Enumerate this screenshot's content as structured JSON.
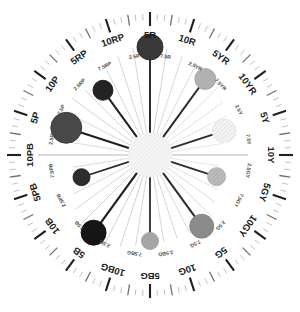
{
  "figure": {
    "type": "polar-hue-wheel",
    "center_x": 150,
    "center_y": 155,
    "background_color": "#ffffff"
  },
  "geometry": {
    "outer_tick_ring_radius": 141,
    "outer_tick_ring_inner_radius": 133,
    "major_label_radius": 121,
    "minor_label_radius": 100,
    "spoke_inner_radius": 22,
    "spoke_outer_radius": 112,
    "hub_radius": 22,
    "hub_fill": "#f2f2f2",
    "hub_hatch_color": "#e2e2e2"
  },
  "chart_data": {
    "type": "scatter",
    "subtitle": "",
    "xlabel": "",
    "ylabel": "",
    "coordinate_system": "polar",
    "angle_units": "degrees",
    "angle_zero_at": "top",
    "angle_direction": "clockwise",
    "grid": true,
    "legend": false,
    "n_spokes": 40,
    "spoke_step_degrees": 9,
    "hue_labels_major": [
      "5R",
      "10R",
      "5YR",
      "10YR",
      "5Y",
      "10Y",
      "5GY",
      "10GY",
      "5G",
      "10G",
      "5BG",
      "10BG",
      "5B",
      "10B",
      "5PB",
      "10PB",
      "5P",
      "10P",
      "5RP",
      "10RP"
    ],
    "hue_labels_minor": [
      "2.5R",
      "7.5R",
      "2.5YR",
      "7.5YR",
      "2.5Y",
      "7.5Y",
      "2.5GY",
      "7.5GY",
      "2.5G",
      "7.5G",
      "2.5BG",
      "7.5BG",
      "2.5B",
      "7.5B",
      "2.5PB",
      "7.5PB",
      "2.5P",
      "7.5P",
      "2.5RP",
      "7.5RP"
    ],
    "categories": [
      "5R",
      "7.5R",
      "10R",
      "2.5YR",
      "5YR",
      "7.5YR",
      "10YR",
      "2.5Y",
      "5Y",
      "7.5Y",
      "10Y",
      "2.5GY",
      "5GY",
      "7.5GY",
      "10GY",
      "2.5G",
      "5G",
      "7.5G",
      "10G",
      "2.5BG",
      "5BG",
      "7.5BG",
      "10BG",
      "2.5B",
      "5B",
      "7.5B",
      "10B",
      "2.5PB",
      "5PB",
      "7.5PB",
      "10PB",
      "2.5P",
      "5P",
      "7.5P",
      "10P",
      "2.5RP",
      "5RP",
      "7.5RP",
      "10RP",
      "2.5R"
    ],
    "spokes": [
      {
        "label": "5R",
        "angle": 0,
        "length": 112,
        "weight": 2.0,
        "color": "#2b2b2b"
      },
      {
        "label": "7.5R",
        "angle": 9,
        "length": 108,
        "weight": 0.7,
        "color": "#bdbdbd"
      },
      {
        "label": "10R",
        "angle": 18,
        "length": 104,
        "weight": 0.7,
        "color": "#c9c9c9"
      },
      {
        "label": "2.5YR",
        "angle": 27,
        "length": 104,
        "weight": 0.7,
        "color": "#cccccc"
      },
      {
        "label": "5YR",
        "angle": 36,
        "length": 98,
        "weight": 2.0,
        "color": "#2b2b2b"
      },
      {
        "label": "7.5YR",
        "angle": 45,
        "length": 96,
        "weight": 0.7,
        "color": "#d0d0d0"
      },
      {
        "label": "10YR",
        "angle": 54,
        "length": 90,
        "weight": 0.7,
        "color": "#d6d6d6"
      },
      {
        "label": "2.5Y",
        "angle": 63,
        "length": 86,
        "weight": 0.7,
        "color": "#dadada"
      },
      {
        "label": "5Y",
        "angle": 72,
        "length": 82,
        "weight": 1.8,
        "color": "#2b2b2b"
      },
      {
        "label": "7.5Y",
        "angle": 81,
        "length": 74,
        "weight": 0.7,
        "color": "#dddddd"
      },
      {
        "label": "10Y",
        "angle": 90,
        "length": 98,
        "weight": 0.7,
        "color": "#9a9a9a"
      },
      {
        "label": "2.5GY",
        "angle": 99,
        "length": 70,
        "weight": 0.7,
        "color": "#dddddd"
      },
      {
        "label": "5GY",
        "angle": 108,
        "length": 74,
        "weight": 1.8,
        "color": "#2b2b2b"
      },
      {
        "label": "7.5GY",
        "angle": 117,
        "length": 76,
        "weight": 0.7,
        "color": "#d6d6d6"
      },
      {
        "label": "10GY",
        "angle": 126,
        "length": 80,
        "weight": 0.7,
        "color": "#cfcfcf"
      },
      {
        "label": "2.5G",
        "angle": 135,
        "length": 86,
        "weight": 0.7,
        "color": "#cccccc"
      },
      {
        "label": "5G",
        "angle": 144,
        "length": 92,
        "weight": 2.0,
        "color": "#2b2b2b"
      },
      {
        "label": "7.5G",
        "angle": 153,
        "length": 88,
        "weight": 0.7,
        "color": "#c9c9c9"
      },
      {
        "label": "10G",
        "angle": 162,
        "length": 88,
        "weight": 0.7,
        "color": "#c4c4c4"
      },
      {
        "label": "2.5BG",
        "angle": 171,
        "length": 88,
        "weight": 0.7,
        "color": "#c4c4c4"
      },
      {
        "label": "5BG",
        "angle": 180,
        "length": 90,
        "weight": 1.8,
        "color": "#2b2b2b"
      },
      {
        "label": "7.5BG",
        "angle": 189,
        "length": 92,
        "weight": 0.7,
        "color": "#c2c2c2"
      },
      {
        "label": "10BG",
        "angle": 198,
        "length": 96,
        "weight": 0.7,
        "color": "#bdbdbd"
      },
      {
        "label": "2.5B",
        "angle": 207,
        "length": 98,
        "weight": 0.7,
        "color": "#bbbbbb"
      },
      {
        "label": "5B",
        "angle": 216,
        "length": 100,
        "weight": 2.2,
        "color": "#1f1f1f"
      },
      {
        "label": "7.5B",
        "angle": 225,
        "length": 96,
        "weight": 0.7,
        "color": "#bdbdbd"
      },
      {
        "label": "10B",
        "angle": 234,
        "length": 92,
        "weight": 0.7,
        "color": "#c4c4c4"
      },
      {
        "label": "2.5PB",
        "angle": 243,
        "length": 86,
        "weight": 0.7,
        "color": "#c9c9c9"
      },
      {
        "label": "5PB",
        "angle": 252,
        "length": 76,
        "weight": 1.8,
        "color": "#2b2b2b"
      },
      {
        "label": "7.5PB",
        "angle": 261,
        "length": 78,
        "weight": 0.7,
        "color": "#cccccc"
      },
      {
        "label": "10PB",
        "angle": 270,
        "length": 112,
        "weight": 0.7,
        "color": "#9a9a9a"
      },
      {
        "label": "2.5P",
        "angle": 279,
        "length": 86,
        "weight": 0.7,
        "color": "#cccccc"
      },
      {
        "label": "5P",
        "angle": 288,
        "length": 92,
        "weight": 2.2,
        "color": "#1f1f1f"
      },
      {
        "label": "7.5P",
        "angle": 297,
        "length": 94,
        "weight": 0.7,
        "color": "#c6c6c6"
      },
      {
        "label": "10P",
        "angle": 306,
        "length": 96,
        "weight": 0.7,
        "color": "#c2c2c2"
      },
      {
        "label": "2.5RP",
        "angle": 315,
        "length": 92,
        "weight": 0.7,
        "color": "#c2c2c2"
      },
      {
        "label": "5RP",
        "angle": 324,
        "length": 84,
        "weight": 2.0,
        "color": "#1f1f1f"
      },
      {
        "label": "7.5RP",
        "angle": 333,
        "length": 96,
        "weight": 0.7,
        "color": "#c2c2c2"
      },
      {
        "label": "10RP",
        "angle": 342,
        "length": 104,
        "weight": 0.7,
        "color": "#c6c6c6"
      },
      {
        "label": "2.5R",
        "angle": 351,
        "length": 108,
        "weight": 0.7,
        "color": "#c6c6c6"
      }
    ],
    "markers": [
      {
        "label": "5R",
        "angle": 0,
        "r": 108,
        "size": 26,
        "fill": "#3a3a3a",
        "stroke": "#2a2a2a"
      },
      {
        "label": "5YR",
        "angle": 36,
        "r": 94,
        "size": 21,
        "fill": "#b5b5b5",
        "stroke": "#a8a8a8"
      },
      {
        "label": "5Y",
        "angle": 72,
        "r": 78,
        "size": 24,
        "fill": "#f4f4f4",
        "stroke": "#ececec"
      },
      {
        "label": "5GY",
        "angle": 108,
        "r": 70,
        "size": 18,
        "fill": "#bcbcbc",
        "stroke": "#b0b0b0"
      },
      {
        "label": "5G",
        "angle": 144,
        "r": 88,
        "size": 24,
        "fill": "#8e8e8e",
        "stroke": "#838383"
      },
      {
        "label": "5BG",
        "angle": 180,
        "r": 86,
        "size": 17,
        "fill": "#a9a9a9",
        "stroke": "#9e9e9e"
      },
      {
        "label": "5B",
        "angle": 216,
        "r": 96,
        "size": 25,
        "fill": "#161616",
        "stroke": "#0e0e0e"
      },
      {
        "label": "5PB",
        "angle": 252,
        "r": 72,
        "size": 17,
        "fill": "#2e2e2e",
        "stroke": "#242424"
      },
      {
        "label": "5P",
        "angle": 288,
        "r": 88,
        "size": 31,
        "fill": "#4a4a4a",
        "stroke": "#3a3a3a"
      },
      {
        "label": "5RP",
        "angle": 324,
        "r": 80,
        "size": 20,
        "fill": "#242424",
        "stroke": "#1a1a1a"
      }
    ],
    "ticks": {
      "major_count": 20,
      "minor_count": 20,
      "fine_count": 120,
      "major_color": "#1f1f1f",
      "minor_color": "#6f6f6f",
      "fine_color": "#b9b9b9"
    }
  },
  "labels": {
    "major": [
      {
        "text": "5R",
        "angle": 0
      },
      {
        "text": "10R",
        "angle": 18
      },
      {
        "text": "5YR",
        "angle": 36
      },
      {
        "text": "10YR",
        "angle": 54
      },
      {
        "text": "5Y",
        "angle": 72
      },
      {
        "text": "10Y",
        "angle": 90
      },
      {
        "text": "5GY",
        "angle": 108
      },
      {
        "text": "10GY",
        "angle": 126
      },
      {
        "text": "5G",
        "angle": 144
      },
      {
        "text": "10G",
        "angle": 162
      },
      {
        "text": "5BG",
        "angle": 180
      },
      {
        "text": "10BG",
        "angle": 198
      },
      {
        "text": "5B",
        "angle": 216
      },
      {
        "text": "10B",
        "angle": 234
      },
      {
        "text": "5PB",
        "angle": 252
      },
      {
        "text": "10PB",
        "angle": 270
      },
      {
        "text": "5P",
        "angle": 288
      },
      {
        "text": "10P",
        "angle": 306
      },
      {
        "text": "5RP",
        "angle": 324
      },
      {
        "text": "10RP",
        "angle": 342
      }
    ],
    "minor": [
      {
        "text": "7.5R",
        "angle": 9
      },
      {
        "text": "2.5YR",
        "angle": 27
      },
      {
        "text": "7.5YR",
        "angle": 45
      },
      {
        "text": "2.5Y",
        "angle": 63
      },
      {
        "text": "7.5Y",
        "angle": 81
      },
      {
        "text": "2.5GY",
        "angle": 99
      },
      {
        "text": "7.5GY",
        "angle": 117
      },
      {
        "text": "2.5G",
        "angle": 135
      },
      {
        "text": "7.5G",
        "angle": 153
      },
      {
        "text": "2.5BG",
        "angle": 171
      },
      {
        "text": "7.5BG",
        "angle": 189
      },
      {
        "text": "2.5B",
        "angle": 207
      },
      {
        "text": "7.5B",
        "angle": 225
      },
      {
        "text": "2.5PB",
        "angle": 243
      },
      {
        "text": "7.5PB",
        "angle": 261
      },
      {
        "text": "2.5P",
        "angle": 279
      },
      {
        "text": "7.5P",
        "angle": 297
      },
      {
        "text": "2.5RP",
        "angle": 315
      },
      {
        "text": "7.5RP",
        "angle": 333
      },
      {
        "text": "2.5R",
        "angle": 351
      }
    ]
  }
}
